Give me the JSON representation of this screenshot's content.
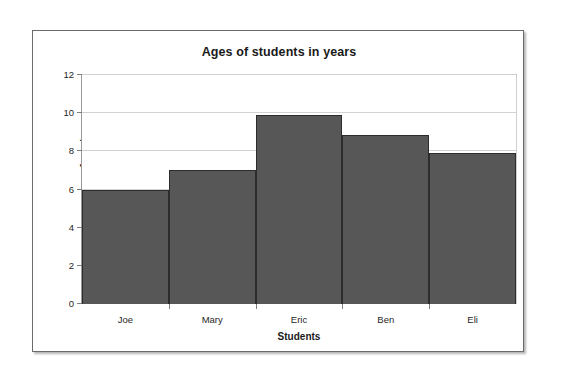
{
  "chart_data": {
    "type": "bar",
    "title": "Ages of students in years",
    "xlabel": "Students",
    "ylabel": "Ages in years",
    "categories": [
      "Joe",
      "Mary",
      "Eric",
      "Ben",
      "Eli"
    ],
    "values": [
      6,
      7,
      9.9,
      8.85,
      7.9
    ],
    "ylim": [
      0,
      12
    ],
    "ytick_labels": [
      "0",
      "2",
      "4",
      "6",
      "8",
      "10",
      "12"
    ],
    "ytick_values": [
      0,
      2,
      4,
      6,
      8,
      10,
      12
    ],
    "grid": true,
    "legend": "none",
    "bar_color": "#575757",
    "bar_border_color": "#2c2c2c",
    "gridline_color": "#d2d2d2",
    "axis_color": "#6f6f6f",
    "plot_background": "#ffffff",
    "frame_border_color": "#6b6b6b"
  }
}
